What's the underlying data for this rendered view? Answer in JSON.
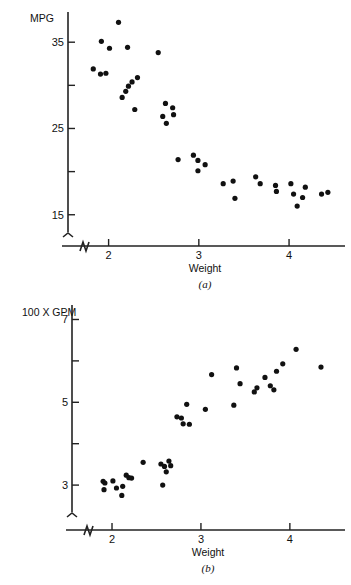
{
  "figure": {
    "footnote": ""
  },
  "chart_data": [
    {
      "id": "a",
      "type": "scatter",
      "title": "",
      "caption": "(a)",
      "xlabel": "Weight",
      "ylabel": "MPG",
      "ylabel_position": "top-left",
      "xlim": [
        1.55,
        4.62
      ],
      "ylim": [
        13.0,
        38.5
      ],
      "xticks": [
        2,
        3,
        4
      ],
      "xtick_labels": [
        "2",
        "3",
        "4"
      ],
      "yticks": [
        15,
        20,
        25,
        30,
        35
      ],
      "ytick_labels": [
        "15",
        "",
        "25",
        "",
        "35"
      ],
      "grid": false,
      "legend": "none",
      "axis_break": {
        "x": true,
        "y": true
      },
      "x": [
        2.11,
        1.92,
        2.01,
        2.21,
        1.83,
        1.91,
        1.97,
        2.32,
        2.26,
        2.22,
        2.19,
        2.15,
        2.55,
        2.63,
        2.71,
        2.6,
        2.72,
        2.64,
        2.29,
        2.77,
        2.94,
        2.99,
        3.07,
        2.99,
        3.27,
        3.38,
        3.63,
        3.68,
        3.85,
        3.86,
        3.4,
        4.02,
        4.05,
        4.18,
        4.15,
        4.09,
        4.36,
        4.43
      ],
      "y": [
        37.3,
        35.1,
        34.3,
        34.4,
        31.9,
        31.3,
        31.4,
        30.9,
        30.4,
        29.9,
        29.3,
        28.6,
        33.8,
        27.9,
        27.4,
        26.4,
        26.6,
        25.6,
        27.2,
        21.4,
        21.9,
        21.3,
        20.8,
        20.1,
        18.6,
        18.9,
        19.4,
        18.6,
        18.4,
        17.7,
        16.9,
        18.6,
        17.4,
        18.2,
        17.0,
        16.0,
        17.4,
        17.6
      ],
      "n_points": 38
    },
    {
      "id": "b",
      "type": "scatter",
      "title": "",
      "caption": "(b)",
      "xlabel": "Weight",
      "ylabel": "100 X GPM",
      "ylabel_position": "top-left",
      "xlim": [
        1.55,
        4.62
      ],
      "ylim": [
        2.35,
        7.35
      ],
      "xticks": [
        2,
        3,
        4
      ],
      "xtick_labels": [
        "2",
        "3",
        "4"
      ],
      "yticks": [
        3,
        4,
        5,
        6,
        7
      ],
      "ytick_labels": [
        "3",
        "",
        "5",
        "",
        "7"
      ],
      "grid": false,
      "legend": "none",
      "axis_break": {
        "x": true,
        "y": true
      },
      "x": [
        1.9,
        1.92,
        2.01,
        1.91,
        2.05,
        2.12,
        2.19,
        2.16,
        2.22,
        2.11,
        2.35,
        2.57,
        2.59,
        2.55,
        2.61,
        2.66,
        2.64,
        2.73,
        2.78,
        2.84,
        2.8,
        2.87,
        3.05,
        3.12,
        3.4,
        3.37,
        3.44,
        3.6,
        3.63,
        3.72,
        3.78,
        3.85,
        3.82,
        4.07,
        3.92,
        4.35
      ],
      "y": [
        3.09,
        3.05,
        3.1,
        2.89,
        2.93,
        2.97,
        3.18,
        3.24,
        3.17,
        2.75,
        3.55,
        3.0,
        3.45,
        3.51,
        3.32,
        3.47,
        3.58,
        4.65,
        4.62,
        4.95,
        4.48,
        4.47,
        4.83,
        5.67,
        5.83,
        4.93,
        5.45,
        5.25,
        5.35,
        5.6,
        5.4,
        5.75,
        5.3,
        6.28,
        5.93,
        5.85
      ],
      "n_points": 36
    }
  ]
}
